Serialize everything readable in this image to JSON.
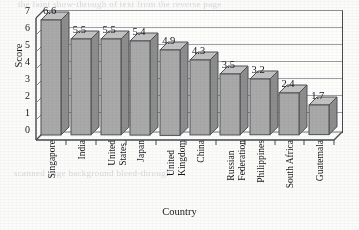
{
  "chart_data": {
    "type": "bar",
    "title": "",
    "subtitle": "",
    "xlabel": "Country",
    "ylabel": "Score",
    "ylim": [
      0,
      7
    ],
    "yticks": [
      0,
      1,
      2,
      3,
      4,
      5,
      6,
      7
    ],
    "grid": true,
    "legend": false,
    "style": "3d-column",
    "bar_color": "#a9a9a9",
    "bar_edge_color": "#4d5055",
    "categories": [
      "Singapore",
      "India",
      "United States",
      "Japan",
      "United Kingdom",
      "China",
      "Russian Federation",
      "Philippines",
      "South Africa",
      "Guatemala"
    ],
    "category_lines": [
      [
        "Singapore"
      ],
      [
        "India"
      ],
      [
        "United",
        "States"
      ],
      [
        "Japan"
      ],
      [
        "United",
        "Kingdom"
      ],
      [
        "China"
      ],
      [
        "Russian",
        "Federation"
      ],
      [
        "Philippines"
      ],
      [
        "South Africa"
      ],
      [
        "Guatemala"
      ]
    ],
    "values": [
      6.6,
      5.5,
      5.5,
      5.4,
      4.9,
      4.3,
      3.5,
      3.2,
      2.4,
      1.7
    ],
    "value_labels": [
      "6.6",
      "5.5",
      "5.5",
      "5.4",
      "4.9",
      "4.3",
      "3.5",
      "3.2",
      "2.4",
      "1.7"
    ]
  },
  "ghost_text": {
    "top": "the faint show-through of text from the reverse page",
    "bottom": "scanned page background bleed-through"
  }
}
